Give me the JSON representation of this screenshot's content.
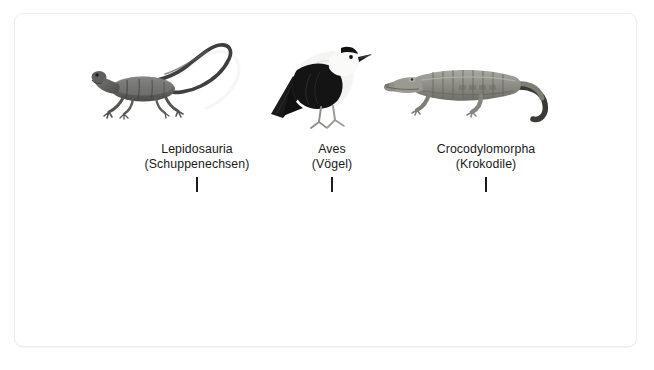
{
  "figure": {
    "caption": "",
    "card": {
      "background": "#ffffff",
      "border_color": "#ececec"
    },
    "taxa": [
      {
        "id": "lepidosauria",
        "scientific_name": "Lepidosauria",
        "common_name": "(Schuppenechsen)",
        "illustration": "lizard-illustration",
        "illustration_color": "#6f6f6f"
      },
      {
        "id": "aves",
        "scientific_name": "Aves",
        "common_name": "(Vögel)",
        "illustration": "bird-illustration",
        "illustration_color": "#1c1c1c"
      },
      {
        "id": "crocodylomorpha",
        "scientific_name": "Crocodylomorpha",
        "common_name": "(Krokodile)",
        "illustration": "crocodile-illustration",
        "illustration_color": "#8a8a85"
      }
    ]
  }
}
